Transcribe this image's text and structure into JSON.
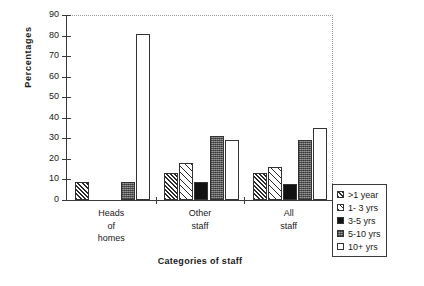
{
  "chart_data": {
    "type": "bar",
    "title": "",
    "xlabel": "Categories of staff",
    "ylabel": "Percentages",
    "categories": [
      "Heads of homes",
      "Other staff",
      "All staff"
    ],
    "category_label_lines": [
      [
        "Heads",
        "of",
        "homes"
      ],
      [
        "Other",
        "staff"
      ],
      [
        "All",
        "staff"
      ]
    ],
    "series": [
      {
        "name": ">1 year",
        "values": [
          9,
          13,
          13
        ],
        "pattern": "dark-diagonal-hatch"
      },
      {
        "name": "1- 3 yrs",
        "values": [
          null,
          18,
          16
        ],
        "pattern": "light-diagonal-hatch"
      },
      {
        "name": "3-5 yrs",
        "values": [
          null,
          9,
          8
        ],
        "pattern": "solid-black"
      },
      {
        "name": "5-10 yrs",
        "values": [
          9,
          31,
          29
        ],
        "pattern": "gray-checker"
      },
      {
        "name": "10+ yrs",
        "values": [
          81,
          29,
          35
        ],
        "pattern": "white"
      }
    ],
    "ylim": [
      0,
      90
    ],
    "yticks": [
      0,
      10,
      20,
      30,
      40,
      50,
      60,
      70,
      80,
      90
    ],
    "grid": false,
    "legend_position": "right-bottom-outside",
    "legend_entries": [
      ">1 year",
      "1- 3 yrs",
      "3-5 yrs",
      "5-10 yrs",
      "10+ yrs"
    ]
  },
  "axis": {
    "y_title": "Percentages",
    "x_title": "Categories of staff",
    "y_tick_labels": [
      "0",
      "10",
      "20",
      "30",
      "40",
      "50",
      "60",
      "70",
      "80",
      "90"
    ]
  }
}
